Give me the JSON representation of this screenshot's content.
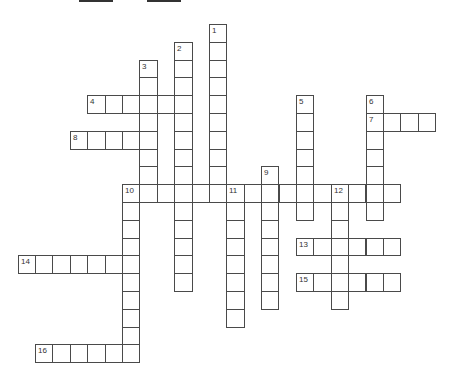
{
  "puzzle": {
    "type": "crossword",
    "cell_width": 17.4,
    "cell_height": 17.8,
    "origin_x": 17.5,
    "origin_y": 24,
    "grid_color": "#4a4a4a",
    "entries": [
      {
        "number": "1",
        "direction": "down",
        "col": 11,
        "row": 0,
        "length": 10
      },
      {
        "number": "2",
        "direction": "down",
        "col": 9,
        "row": 1,
        "length": 14
      },
      {
        "number": "3",
        "direction": "down",
        "col": 7,
        "row": 2,
        "length": 8
      },
      {
        "number": "4",
        "direction": "across",
        "col": 4,
        "row": 4,
        "length": 6
      },
      {
        "number": "5",
        "direction": "down",
        "col": 16,
        "row": 4,
        "length": 7
      },
      {
        "number": "6",
        "direction": "down",
        "col": 20,
        "row": 4,
        "length": 7
      },
      {
        "number": "7",
        "direction": "across",
        "col": 20,
        "row": 5,
        "length": 4
      },
      {
        "number": "8",
        "direction": "across",
        "col": 3,
        "row": 6,
        "length": 5
      },
      {
        "number": "9",
        "direction": "down",
        "col": 14,
        "row": 8,
        "length": 8
      },
      {
        "number": "10",
        "direction": "across",
        "col": 6,
        "row": 9,
        "length": 16
      },
      {
        "number": "10",
        "direction": "down",
        "col": 6,
        "row": 9,
        "length": 10
      },
      {
        "number": "11",
        "direction": "down",
        "col": 12,
        "row": 9,
        "length": 8
      },
      {
        "number": "12",
        "direction": "down",
        "col": 18,
        "row": 9,
        "length": 7
      },
      {
        "number": "13",
        "direction": "across",
        "col": 16,
        "row": 12,
        "length": 6
      },
      {
        "number": "14",
        "direction": "across",
        "col": 0,
        "row": 13,
        "length": 7
      },
      {
        "number": "15",
        "direction": "across",
        "col": 16,
        "row": 14,
        "length": 6
      },
      {
        "number": "16",
        "direction": "across",
        "col": 1,
        "row": 18,
        "length": 6
      }
    ]
  }
}
